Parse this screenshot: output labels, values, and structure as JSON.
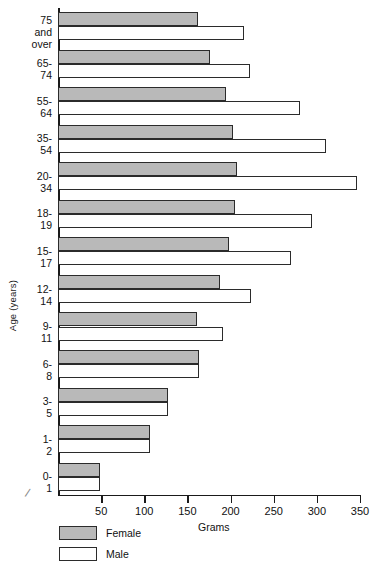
{
  "chart_data": {
    "type": "bar",
    "orientation": "horizontal",
    "title": "",
    "xlabel": "Grams",
    "ylabel": "Age (years)",
    "categories": [
      "75 and\nover",
      "65-74",
      "55-64",
      "35-54",
      "20-34",
      "18-19",
      "15-17",
      "12-14",
      "9-11",
      "6-8",
      "3-5",
      "1-2",
      "0-1"
    ],
    "series": [
      {
        "name": "Female",
        "color": "#b9b9b9",
        "values": [
          162,
          176,
          195,
          203,
          208,
          205,
          198,
          188,
          161,
          163,
          127,
          107,
          49
        ]
      },
      {
        "name": "Male",
        "color": "#ffffff",
        "values": [
          216,
          222,
          280,
          311,
          346,
          294,
          270,
          224,
          191,
          163,
          127,
          107,
          49
        ]
      }
    ],
    "xlim": [
      0,
      350
    ],
    "xticks": [
      0,
      50,
      100,
      150,
      200,
      250,
      300,
      350
    ],
    "xtick_labels": [
      "",
      "50",
      "100",
      "150",
      "200",
      "250",
      "300",
      "350"
    ],
    "grid": false,
    "legend_position": "bottom-left"
  },
  "legend": {
    "items": [
      {
        "label": "Female",
        "swatch": "female"
      },
      {
        "label": "Male",
        "swatch": "male"
      }
    ]
  },
  "axes": {
    "x_title": "Grams",
    "y_title": "Age (years)"
  }
}
